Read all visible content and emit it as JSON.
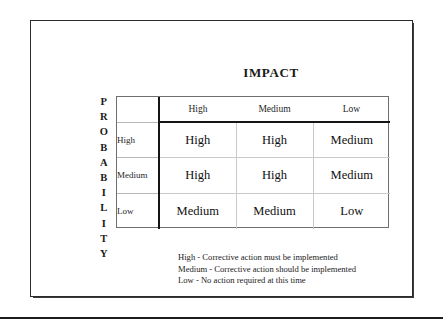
{
  "title": "IMPACT",
  "probability_axis": {
    "label": "PROBABILITY",
    "letters": [
      "P",
      "R",
      "O",
      "B",
      "A",
      "B",
      "I",
      "L",
      "I",
      "T",
      "Y"
    ]
  },
  "matrix": {
    "corner_label": "",
    "impact_headers": [
      "High",
      "Medium",
      "Low"
    ],
    "probability_labels": [
      "High",
      "Medium",
      "Low"
    ],
    "cells": [
      [
        "High",
        "High",
        "Medium"
      ],
      [
        "High",
        "High",
        "Medium"
      ],
      [
        "Medium",
        "Medium",
        "Low"
      ]
    ]
  },
  "legend": [
    "High - Corrective action must be implemented",
    "Medium - Corrective action should be implemented",
    "Low - No action required at this time"
  ],
  "colors": {
    "text": "#1a1a1a",
    "heavy_rule": "#151515",
    "light_grid": "#c9c9c9",
    "frame": "#2b2b2b",
    "background": "#ffffff"
  }
}
